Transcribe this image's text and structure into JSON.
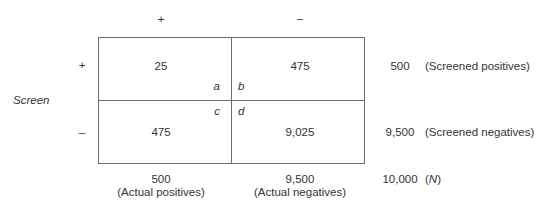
{
  "column_headers": [
    "+",
    "–"
  ],
  "row_headers": [
    "+",
    "–"
  ],
  "row_axis_label": "Screen",
  "cells": {
    "a": {
      "value": "25",
      "label": "a"
    },
    "b": {
      "value": "475",
      "label": "b"
    },
    "c": {
      "value": "475",
      "label": "c"
    },
    "d": {
      "value": "9,025",
      "label": "d"
    }
  },
  "row_totals": [
    {
      "value": "500",
      "label": "(Screened positives)"
    },
    {
      "value": "9,500",
      "label": "(Screened negatives)"
    }
  ],
  "column_totals": [
    {
      "value": "500",
      "label": "(Actual positives)"
    },
    {
      "value": "9,500",
      "label": "(Actual negatives)"
    }
  ],
  "grand_total": {
    "value": "10,000",
    "label_open": "(",
    "label_var": "N",
    "label_close": ")"
  }
}
